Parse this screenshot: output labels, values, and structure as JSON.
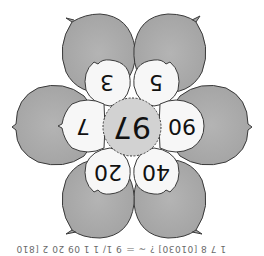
{
  "diagram": {
    "type": "number-flower",
    "orientation": "rotated-180",
    "center": {
      "value": "97",
      "fill": "#d2d2d2"
    },
    "inner_petals": [
      {
        "position": "upper-left",
        "value": "3"
      },
      {
        "position": "upper-right",
        "value": "5"
      },
      {
        "position": "right",
        "value": "90"
      },
      {
        "position": "lower-right",
        "value": "40"
      },
      {
        "position": "lower-left",
        "value": "20"
      },
      {
        "position": "left",
        "value": "7"
      }
    ],
    "outer_petals": [
      {
        "position": "top-left"
      },
      {
        "position": "top-right"
      },
      {
        "position": "right"
      },
      {
        "position": "bottom-right"
      },
      {
        "position": "bottom-left"
      },
      {
        "position": "left"
      }
    ],
    "colors": {
      "outer_petal": "#a9a9a9",
      "inner_petal": "#f7f7f7",
      "center": "#d2d2d2",
      "outline": "#3a3a3a"
    }
  },
  "caption": {
    "text": "1 7 8 [01030] ? ~ ＝ 9 1/ 1 1 09 20 2 [810]"
  }
}
